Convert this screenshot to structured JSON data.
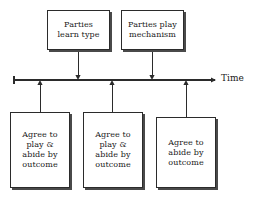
{
  "diagram": {
    "axis": {
      "label": "Time",
      "direction": "left-to-right",
      "start_x": 14,
      "end_x": 215,
      "y": 80,
      "has_arrowhead": true,
      "has_start_tick": true
    },
    "line_color": "#2b2b2b",
    "shadow_color": "#4a4a4a",
    "background_color": "#ffffff",
    "text_color": "#1a1a1a",
    "top_boxes": [
      {
        "id": "parties-learn-type",
        "text": "Parties\nlearn type",
        "x": 47,
        "y": 10,
        "width": 63,
        "height": 40,
        "connector_x": 78,
        "arrow_direction": "down"
      },
      {
        "id": "parties-play-mechanism",
        "text": "Parties play\nmechanism",
        "x": 121,
        "y": 10,
        "width": 63,
        "height": 40,
        "connector_x": 152,
        "arrow_direction": "down"
      }
    ],
    "bottom_boxes": [
      {
        "id": "agree-play-abide-1",
        "text": "Agree to\nplay &\nabide by\noutcome",
        "x": 10,
        "y": 112,
        "width": 60,
        "height": 76,
        "connector_x": 40,
        "arrow_direction": "up"
      },
      {
        "id": "agree-play-abide-2",
        "text": "Agree to\nplay &\nabide by\noutcome",
        "x": 83,
        "y": 112,
        "width": 60,
        "height": 76,
        "connector_x": 112,
        "arrow_direction": "up"
      },
      {
        "id": "agree-abide",
        "text": "Agree to\nabide by\noutcome",
        "x": 156,
        "y": 117,
        "width": 60,
        "height": 71,
        "connector_x": 186,
        "arrow_direction": "up"
      }
    ]
  }
}
